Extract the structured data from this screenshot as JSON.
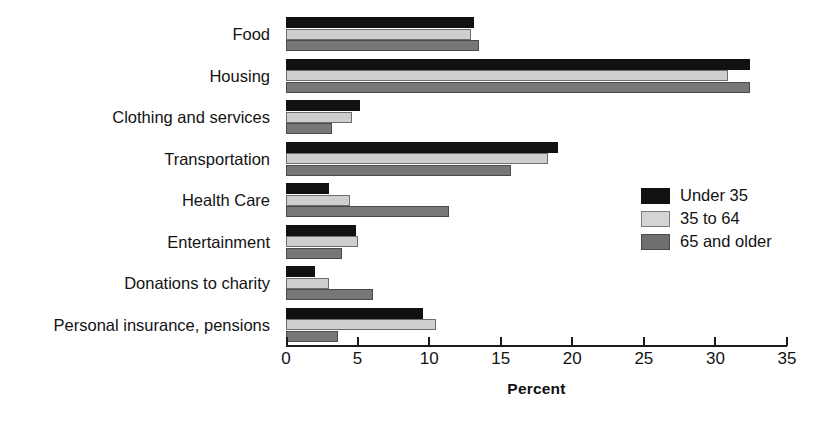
{
  "chart_data": {
    "type": "bar",
    "orientation": "horizontal",
    "title": "",
    "xlabel": "Percent",
    "ylabel": "",
    "xlim": [
      0,
      35
    ],
    "xticks": [
      0,
      5,
      10,
      15,
      20,
      25,
      30,
      35
    ],
    "xtick_labels": [
      "0",
      "5",
      "10",
      "15",
      "20",
      "25",
      "30",
      "35"
    ],
    "grid": false,
    "legend_position": "right-middle",
    "categories": [
      "Food",
      "Housing",
      "Clothing and services",
      "Transportation",
      "Health Care",
      "Entertainment",
      "Donations to charity",
      "Personal insurance, pensions"
    ],
    "series": [
      {
        "name": "Under 35",
        "color": "#111111",
        "values": [
          13.1,
          32.4,
          5.2,
          19.0,
          3.0,
          4.9,
          2.0,
          9.6
        ]
      },
      {
        "name": "35 to 64",
        "color": "#cfcfcf",
        "values": [
          12.9,
          30.9,
          4.6,
          18.3,
          4.5,
          5.0,
          3.0,
          10.5
        ]
      },
      {
        "name": "65 and older",
        "color": "#777777",
        "values": [
          13.5,
          32.4,
          3.2,
          15.7,
          11.4,
          3.9,
          6.1,
          3.6
        ]
      }
    ]
  },
  "axis": {
    "title": "Percent"
  },
  "legend": {
    "entries": [
      {
        "label": "Under 35"
      },
      {
        "label": "35 to 64"
      },
      {
        "label": "65 and older"
      }
    ]
  }
}
